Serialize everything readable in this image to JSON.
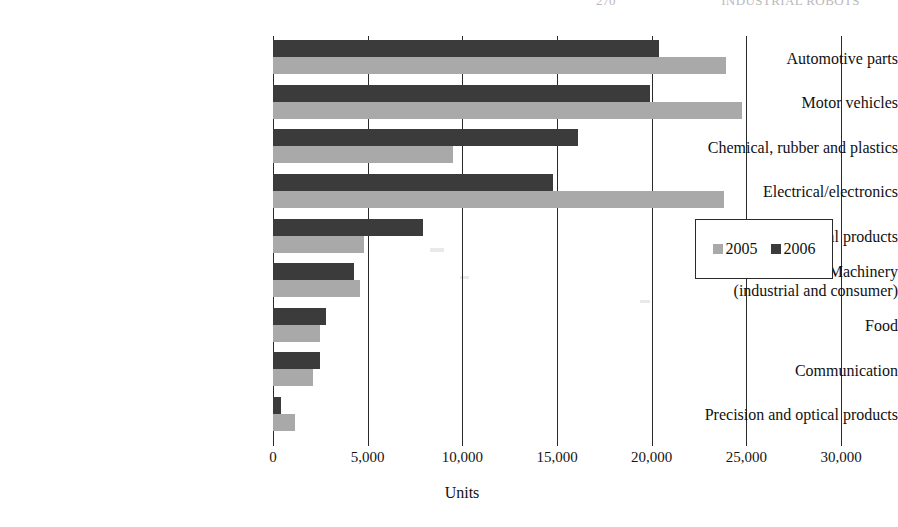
{
  "header": {
    "page_number": "270",
    "running_title": "INDUSTRIAL ROBOTS"
  },
  "chart_data": {
    "type": "bar",
    "orientation": "horizontal",
    "title": "",
    "xlabel": "Units",
    "ylabel": "",
    "xlim": [
      0,
      30000
    ],
    "xticks": [
      0,
      5000,
      10000,
      15000,
      20000,
      25000,
      30000
    ],
    "xtick_labels": [
      "0",
      "5,000",
      "10,000",
      "15,000",
      "20,000",
      "25,000",
      "30,000"
    ],
    "grid": true,
    "grid_axis": "x",
    "legend_position": "center-right",
    "categories": [
      "Automotive parts",
      "Motor vehicles",
      "Chemical, rubber and plastics",
      "Electrical/electronics",
      "Metal products",
      "Machinery\n(industrial and consumer)",
      "Food",
      "Communication",
      "Precision and optical products"
    ],
    "series": [
      {
        "name": "2005",
        "color": "#a9a9a9",
        "values": [
          23900,
          24750,
          9500,
          23800,
          4800,
          4600,
          2500,
          2100,
          1150
        ]
      },
      {
        "name": "2006",
        "color": "#3b3b3b",
        "values": [
          20400,
          19900,
          16100,
          14800,
          7900,
          4300,
          2800,
          2500,
          400
        ]
      }
    ]
  },
  "legend": {
    "entries": [
      {
        "label": "2005",
        "swatch": "legend-swatch-2005"
      },
      {
        "label": "2006",
        "swatch": "legend-swatch-2006"
      }
    ]
  },
  "axis": {
    "x_title": "Units"
  }
}
